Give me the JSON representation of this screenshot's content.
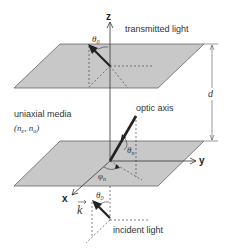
{
  "diagram": {
    "labels": {
      "z_axis": "z",
      "y_axis": "y",
      "x_axis": "x",
      "transmitted": "transmitted light",
      "incident": "incident light",
      "media": "uniaxial media",
      "indices": "(n",
      "indices_e": "e",
      "indices_sep": ", n",
      "indices_o": "o",
      "indices_close": ")",
      "optic_axis": "optic axis",
      "thickness": "d",
      "theta": "θ",
      "theta0_sub": "0",
      "thetan_sub": "n",
      "phi": "φ",
      "phin_sub": "n",
      "k_vector": "k"
    },
    "colors": {
      "plane_fill": "#c8c8c8",
      "plane_stroke": "#555555",
      "line": "#333333"
    }
  }
}
